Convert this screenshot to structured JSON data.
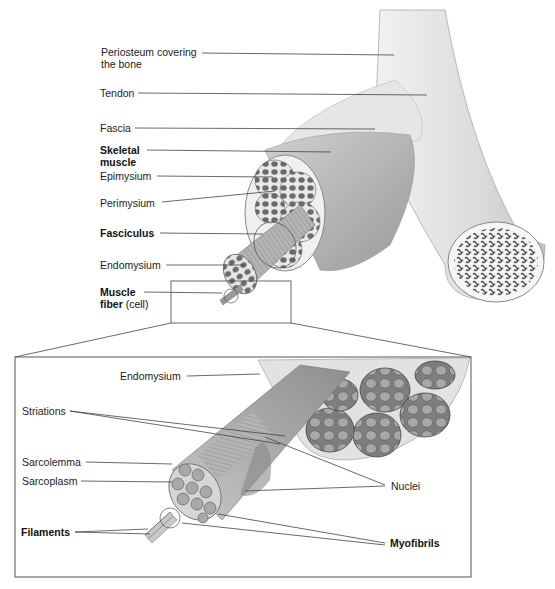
{
  "upper_labels": {
    "periosteum_line1": "Periosteum covering",
    "periosteum_line2": "the bone",
    "tendon": "Tendon",
    "fascia": "Fascia",
    "skeletal_line1": "Skeletal",
    "skeletal_line2": "muscle",
    "epimysium": "Epimysium",
    "perimysium": "Perimysium",
    "fasciculus": "Fasciculus",
    "endomysium": "Endomysium",
    "muscle_fiber_line1": "Muscle",
    "muscle_fiber_line2_bold": "fiber",
    "muscle_fiber_line2_normal": " (cell)"
  },
  "inset_labels": {
    "endomysium": "Endomysium",
    "striations": "Striations",
    "sarcolemma": "Sarcolemma",
    "sarcoplasm": "Sarcoplasm",
    "filaments": "Filaments",
    "nuclei": "Nuclei",
    "myofibrils": "Myofibrils"
  },
  "colors": {
    "leader_line": "#444444",
    "muscle_fill": "#b8b8b8",
    "fascicle_dots": "#6a6a6a",
    "bone_fill": "#e4e4e4"
  }
}
